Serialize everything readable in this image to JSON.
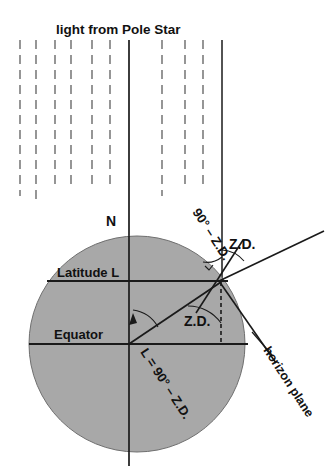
{
  "figure": {
    "title": "light from Pole Star",
    "background_color": "#ffffff",
    "earth_color": "#a8a8a8",
    "line_color": "#1a1a1a",
    "ray_color": "#5e5e5e"
  },
  "labels": {
    "pole_star_light": "light from Pole Star",
    "north_pole": "N",
    "latitude": "Latitude L",
    "equator": "Equator",
    "zenith_distance_upper": "Z.D.",
    "zenith_distance_lower": "Z.D.",
    "ninety_minus_zd": "90° – Z.D.",
    "latitude_equation": "L = 90° – Z.D.",
    "horizon_plane": "horizon plane"
  },
  "geometry": {
    "earth_center_x": 137,
    "earth_center_y": 344,
    "earth_radius": 108,
    "observer_x": 219,
    "observer_y": 281,
    "polar_axis_x": 129,
    "zenith_axis_x": 222,
    "equator_y": 344,
    "latitude_line_y": 281,
    "ray_count": 9,
    "ray_x_positions": [
      20,
      36,
      55,
      71,
      92,
      110,
      162,
      185,
      203
    ],
    "ray_top_y": 40,
    "solid_ray_left_x": 129,
    "solid_ray_right_x": 222
  },
  "angles": {
    "zenith_distance_deg": "Z.D.",
    "complement_deg": "90° – Z.D.",
    "latitude_relation": "L = 90° – Z.D."
  }
}
